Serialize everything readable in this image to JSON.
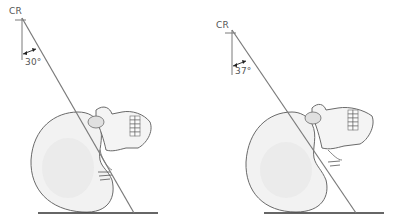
{
  "figure": {
    "panels": [
      {
        "id": "left",
        "cr_label": "CR",
        "angle_label": "30°",
        "angle_degrees": 30
      },
      {
        "id": "right",
        "cr_label": "CR",
        "angle_label": "37°",
        "angle_degrees": 37
      }
    ],
    "colors": {
      "line": "#7a7a7a",
      "skull_fill": "#f2f2f2",
      "skull_stroke": "#6a6a6a",
      "shadow": "#d6d6d6",
      "baseline": "#333333",
      "text": "#555555"
    }
  }
}
